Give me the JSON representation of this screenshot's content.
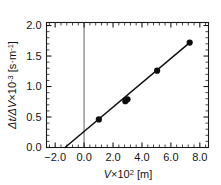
{
  "chart_data": {
    "type": "scatter",
    "title": "",
    "subtitle": "",
    "xlabel": "V×10²  [m]",
    "xlabel_parts": {
      "symbol": "V",
      "factor": "×10",
      "exponent": "2",
      "unit": "[m]"
    },
    "ylabel": "Δt/ΔV×10⁻³  [s·m⁻¹]",
    "ylabel_parts": {
      "symbol": "Δt/ΔV",
      "factor": "×10",
      "exponent": "-3",
      "unit": "[s·m",
      "unit_exponent": "-1",
      "unit_close": "]"
    },
    "xlim": [
      -2.6,
      8.6
    ],
    "ylim": [
      0.0,
      2.05
    ],
    "xticks": [
      -2.0,
      0.0,
      2.0,
      4.0,
      6.0,
      8.0
    ],
    "xticklabels": [
      "−2.0",
      "0.0",
      "2.0",
      "4.0",
      "6.0",
      "8.0"
    ],
    "yticks": [
      0.0,
      0.5,
      1.0,
      1.5,
      2.0
    ],
    "yticklabels": [
      "0.0",
      "0.5",
      "1.0",
      "1.5",
      "2.0"
    ],
    "x_minor_step": 0.4,
    "y_minor_step": 0.1,
    "grid": false,
    "legend": null,
    "ticks_direction": "in",
    "frame": "box",
    "x": [
      1.02,
      2.85,
      3.0,
      5.05,
      7.3
    ],
    "y": [
      0.46,
      0.76,
      0.79,
      1.26,
      1.72
    ],
    "series": [
      {
        "name": "measured",
        "marker": "filled-circle",
        "marker_color": "#0d0d0d",
        "points": [
          {
            "x": 1.02,
            "y": 0.46
          },
          {
            "x": 2.85,
            "y": 0.76
          },
          {
            "x": 3.0,
            "y": 0.79
          },
          {
            "x": 5.05,
            "y": 1.26
          },
          {
            "x": 7.3,
            "y": 1.72
          }
        ]
      },
      {
        "name": "linear-fit",
        "type": "line",
        "line_color": "#111111",
        "x_start": -1.32,
        "y_start": 0.0,
        "x_end": 7.32,
        "y_end": 1.725
      }
    ],
    "reference_lines": [
      {
        "name": "v-zero",
        "orientation": "vertical",
        "x": 0.0,
        "color": "#a8a8a8"
      }
    ],
    "colors": {
      "marker": "#0d0d0d",
      "fit": "#111111",
      "reference": "#a8a8a8",
      "axis": "#1a1a1a",
      "background": "#ffffff"
    }
  }
}
